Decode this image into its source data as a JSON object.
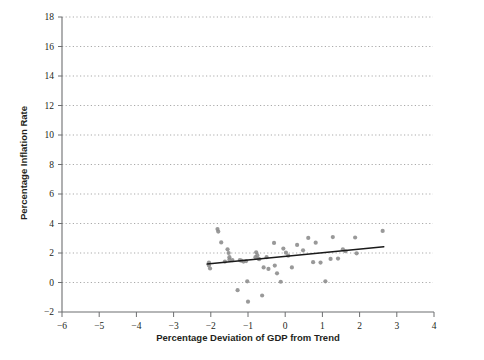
{
  "chart_data": {
    "type": "scatter",
    "title": "",
    "xlabel": "Percentage Deviation of GDP from Trend",
    "ylabel": "Percentage Inflation Rate",
    "xlim": [
      -6,
      4
    ],
    "ylim": [
      -2,
      18
    ],
    "xticks": [
      -6,
      -5,
      -4,
      -3,
      -2,
      -1,
      0,
      1,
      2,
      3,
      4
    ],
    "xtick_labels": [
      "−6",
      "−5",
      "−4",
      "−3",
      "−2",
      "−1",
      "0",
      "1",
      "2",
      "3",
      "4"
    ],
    "yticks": [
      -2,
      0,
      2,
      4,
      6,
      8,
      10,
      12,
      14,
      16,
      18
    ],
    "ytick_labels": [
      "−2",
      "0",
      "2",
      "4",
      "6",
      "8",
      "10",
      "12",
      "14",
      "16",
      "18"
    ],
    "grid": "horizontal-dotted",
    "legend": "none",
    "point_color": "#8b8b8b",
    "trend_color": "#1a1a1a",
    "grid_color": "#9b9b9b",
    "axis_color": "#6d6e70",
    "points": [
      [
        -2.05,
        1.35
      ],
      [
        -2.05,
        1.15
      ],
      [
        -2.02,
        0.95
      ],
      [
        -1.82,
        3.62
      ],
      [
        -1.8,
        3.45
      ],
      [
        -1.72,
        2.72
      ],
      [
        -1.62,
        1.42
      ],
      [
        -1.55,
        2.25
      ],
      [
        -1.52,
        2.0
      ],
      [
        -1.5,
        1.72
      ],
      [
        -1.5,
        1.55
      ],
      [
        -1.42,
        1.52
      ],
      [
        -1.28,
        -0.52
      ],
      [
        -1.22,
        1.52
      ],
      [
        -1.18,
        1.48
      ],
      [
        -1.12,
        1.42
      ],
      [
        -1.05,
        1.45
      ],
      [
        -1.02,
        0.08
      ],
      [
        -1.0,
        -1.3
      ],
      [
        -0.8,
        1.72
      ],
      [
        -0.78,
        2.05
      ],
      [
        -0.75,
        1.85
      ],
      [
        -0.72,
        1.62
      ],
      [
        -0.7,
        1.58
      ],
      [
        -0.62,
        -0.88
      ],
      [
        -0.58,
        1.02
      ],
      [
        -0.5,
        1.72
      ],
      [
        -0.45,
        0.92
      ],
      [
        -0.3,
        2.68
      ],
      [
        -0.28,
        1.15
      ],
      [
        -0.22,
        0.62
      ],
      [
        -0.12,
        0.05
      ],
      [
        -0.05,
        2.3
      ],
      [
        0.02,
        2.02
      ],
      [
        0.08,
        1.82
      ],
      [
        0.18,
        1.02
      ],
      [
        0.32,
        2.55
      ],
      [
        0.48,
        2.18
      ],
      [
        0.62,
        3.02
      ],
      [
        0.75,
        1.38
      ],
      [
        0.82,
        2.7
      ],
      [
        0.95,
        1.35
      ],
      [
        1.08,
        0.08
      ],
      [
        1.22,
        1.6
      ],
      [
        1.28,
        3.08
      ],
      [
        1.42,
        1.62
      ],
      [
        1.55,
        2.25
      ],
      [
        1.62,
        2.12
      ],
      [
        1.88,
        3.05
      ],
      [
        1.92,
        1.98
      ],
      [
        2.62,
        3.5
      ]
    ],
    "trend": {
      "x0": -2.1,
      "y0": 1.25,
      "x1": 2.65,
      "y1": 2.42
    }
  }
}
